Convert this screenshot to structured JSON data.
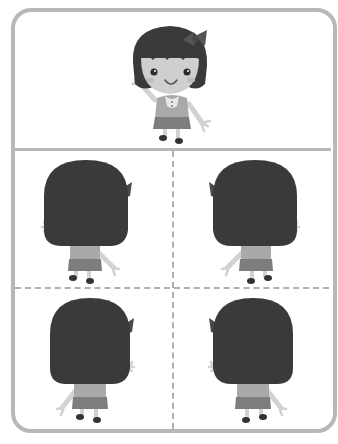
{
  "worksheet": {
    "title": "",
    "layout": "one front-facing figure above a 2x2 grid of back-facing figures",
    "top_panel": {
      "figure": "girl-front-waving",
      "description": "Girl with black bob hair and bow, facing forward, waving right hand"
    },
    "grid_panels": [
      {
        "position": "top-left",
        "figure": "girl-back",
        "bow_side": "right",
        "waving_hand": "left"
      },
      {
        "position": "top-right",
        "figure": "girl-back",
        "bow_side": "left",
        "waving_hand": "right"
      },
      {
        "position": "bottom-left",
        "figure": "girl-back",
        "bow_side": "right",
        "waving_hand": "right"
      },
      {
        "position": "bottom-right",
        "figure": "girl-back",
        "bow_side": "left",
        "waving_hand": "left"
      }
    ]
  },
  "colors": {
    "frame": "#b8b8b8",
    "dash": "#b0b0b0",
    "hair": "#3a3a3a",
    "skin": "#cfcfcf",
    "shirt": "#a9a9a9",
    "skirt": "#7d7d7d",
    "shoes": "#333333"
  }
}
